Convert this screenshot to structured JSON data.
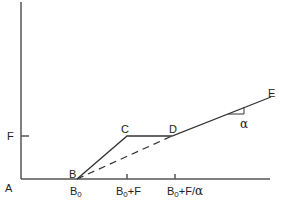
{
  "diagram": {
    "type": "piecewise-linear-plot",
    "axis_origin_label": "A",
    "y_tick_label": "F",
    "points": {
      "B": {
        "label": "B"
      },
      "C": {
        "label": "C"
      },
      "D": {
        "label": "D"
      },
      "E": {
        "label": "E"
      }
    },
    "x_ticks": [
      {
        "main": "B",
        "sub": "0",
        "suffix": ""
      },
      {
        "main": "B",
        "sub": "0",
        "suffix": "+F"
      },
      {
        "main": "B",
        "sub": "0",
        "suffix": "+F/"
      }
    ],
    "slope_label": "α",
    "x_tick_3_greek": "α",
    "segments": [
      {
        "from": "B",
        "to": "C",
        "style": "solid"
      },
      {
        "from": "C",
        "to": "D",
        "style": "solid"
      },
      {
        "from": "D",
        "to": "E",
        "style": "solid"
      },
      {
        "from": "B",
        "to": "D",
        "style": "dashed"
      }
    ],
    "colors": {
      "line": "#333333",
      "axis": "#555555",
      "background": "#ffffff"
    }
  }
}
